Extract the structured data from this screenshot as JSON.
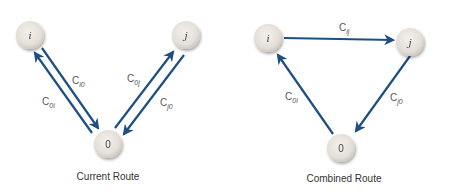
{
  "colors": {
    "edge": "#1f4e80",
    "node_fill": "#e6e1da",
    "node_stroke": "#d4cec6",
    "text": "#444444"
  },
  "left_diagram": {
    "caption": "Current Route",
    "nodes": [
      {
        "id": "i",
        "label": "i"
      },
      {
        "id": "j",
        "label": "j"
      },
      {
        "id": "0",
        "label": "0"
      }
    ],
    "edges": [
      {
        "from": "i",
        "to": "0",
        "label_main": "C",
        "label_sub": "i0"
      },
      {
        "from": "0",
        "to": "i",
        "label_main": "C",
        "label_sub": "0i"
      },
      {
        "from": "0",
        "to": "j",
        "label_main": "C",
        "label_sub": "0j"
      },
      {
        "from": "j",
        "to": "0",
        "label_main": "C",
        "label_sub": "j0"
      }
    ]
  },
  "right_diagram": {
    "caption": "Combined Route",
    "nodes": [
      {
        "id": "i",
        "label": "i"
      },
      {
        "id": "j",
        "label": "j"
      },
      {
        "id": "0",
        "label": "0"
      }
    ],
    "edges": [
      {
        "from": "i",
        "to": "j",
        "label_main": "C",
        "label_sub": "ij"
      },
      {
        "from": "j",
        "to": "0",
        "label_main": "C",
        "label_sub": "j0"
      },
      {
        "from": "0",
        "to": "i",
        "label_main": "C",
        "label_sub": "0i"
      }
    ]
  }
}
